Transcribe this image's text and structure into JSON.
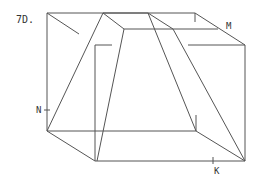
{
  "problem": {
    "number_label": "7D."
  },
  "labels": {
    "M": "M",
    "N": "N",
    "K": "K"
  },
  "colors": {
    "line": "#555555",
    "text": "#333333",
    "background": "#ffffff"
  }
}
